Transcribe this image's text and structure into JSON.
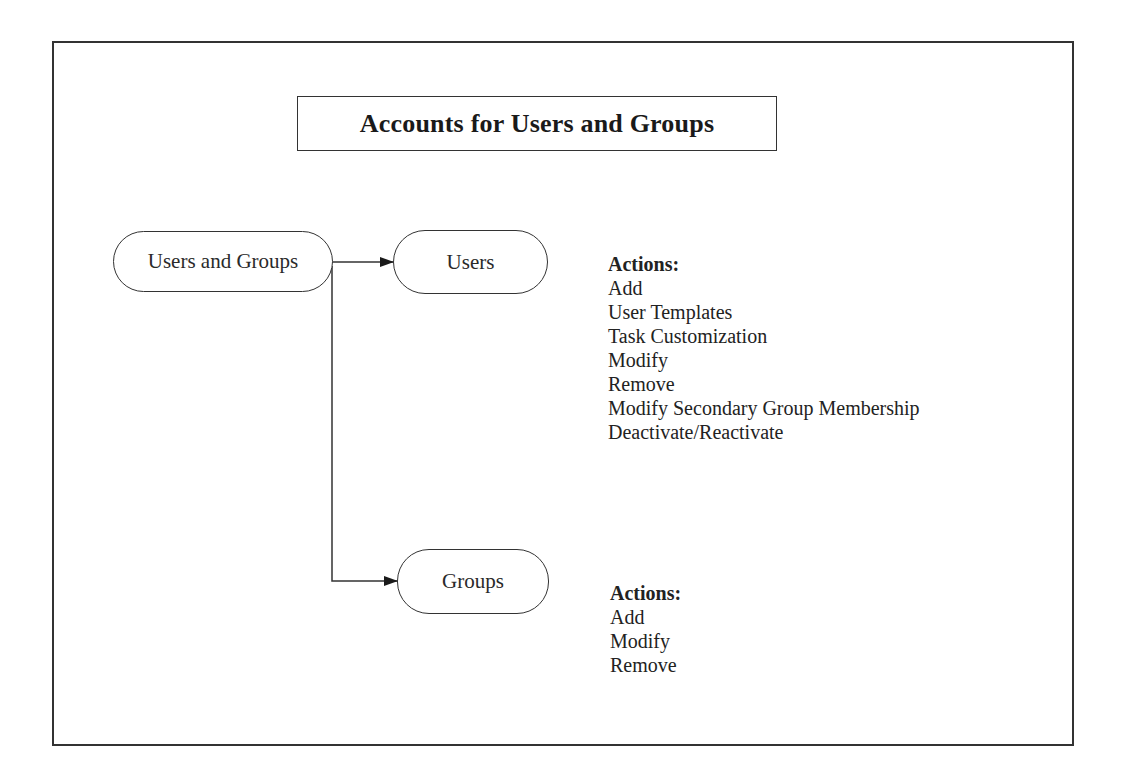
{
  "diagram": {
    "title": "Accounts for Users and Groups",
    "nodes": {
      "root": {
        "label": "Users and Groups"
      },
      "users": {
        "label": "Users"
      },
      "groups": {
        "label": "Groups"
      }
    },
    "users_actions": {
      "header": "Actions:",
      "items": [
        "Add",
        "User Templates",
        "Task Customization",
        "Modify",
        "Remove",
        "Modify Secondary Group Membership",
        "Deactivate/Reactivate"
      ]
    },
    "groups_actions": {
      "header": "Actions:",
      "items": [
        "Add",
        "Modify",
        "Remove"
      ]
    },
    "edges": [
      {
        "from": "Users and Groups",
        "to": "Users"
      },
      {
        "from": "Users and Groups",
        "to": "Groups"
      }
    ],
    "colors": {
      "line": "#333333",
      "text": "#1a1a1a",
      "background": "#ffffff"
    }
  }
}
